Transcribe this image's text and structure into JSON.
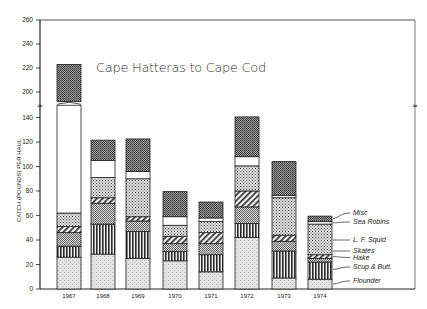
{
  "chart_data": {
    "type": "bar",
    "stacked": true,
    "title": "Cape Hatteras to Cape Cod",
    "xlabel": "",
    "ylabel": "CATCH (POUNDS) PER HAUL",
    "ylim": [
      0,
      260
    ],
    "axis_break": {
      "from": 150,
      "to": 190
    },
    "yticks": [
      0,
      20,
      40,
      60,
      80,
      100,
      120,
      140,
      200,
      220,
      240,
      260
    ],
    "grid": false,
    "legend_position": "right, leader lines to 1974 bar",
    "categories": [
      "1967",
      "1968",
      "1969",
      "1970",
      "1971",
      "1972",
      "1973",
      "1974"
    ],
    "series": [
      {
        "name": "Flounder",
        "pattern": "light-stipple",
        "values": [
          26,
          28.5,
          25,
          23,
          14,
          42,
          9,
          8
        ]
      },
      {
        "name": "Scup & Butt.",
        "pattern": "vertical-stripes",
        "values": [
          9,
          24.5,
          22,
          7.5,
          14,
          11.5,
          22,
          14
        ]
      },
      {
        "name": "Hake",
        "pattern": "checker",
        "values": [
          11,
          17,
          8.5,
          6.5,
          9,
          13.5,
          8,
          3
        ]
      },
      {
        "name": "Skates",
        "pattern": "diagonal-stripes",
        "values": [
          5,
          4.5,
          3.5,
          6,
          9,
          13,
          5,
          3
        ]
      },
      {
        "name": "L. F. Squid",
        "pattern": "dense-dots",
        "values": [
          11,
          16.5,
          31,
          9,
          9,
          20.5,
          30.5,
          25
        ]
      },
      {
        "name": "Sea Robins",
        "pattern": "white",
        "values": [
          130,
          14,
          6,
          7,
          3,
          7.5,
          2,
          2
        ]
      },
      {
        "name": "Misc",
        "pattern": "dark-checker",
        "values": [
          31,
          16.5,
          26.5,
          20.5,
          13,
          32.5,
          27.5,
          4.5
        ]
      }
    ],
    "totals": [
      223,
      121.5,
      122.5,
      79.5,
      71,
      140.5,
      104,
      59.5
    ]
  },
  "legend": {
    "items": [
      {
        "label": "Misc",
        "value_at": 57.5
      },
      {
        "label": "Sea Robins",
        "value_at": 54
      },
      {
        "label": "L. F. Squid",
        "value_at": 40
      },
      {
        "label": "Skates",
        "value_at": 31
      },
      {
        "label": "Hake",
        "value_at": 26.5
      },
      {
        "label": "Scup & Butt.",
        "value_at": 16
      },
      {
        "label": "Flounder",
        "value_at": 4
      }
    ]
  },
  "colors": {
    "axis": "#333333",
    "outline": "#222222",
    "background": "#ffffff"
  }
}
